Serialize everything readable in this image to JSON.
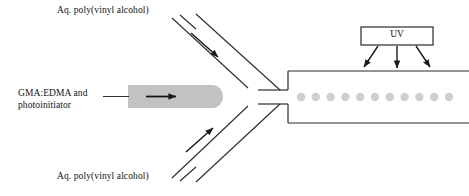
{
  "figure": {
    "background_color": "#ffffff",
    "line_color": "#2b2b2b",
    "droplet_color": "#cfcfcf",
    "tube_fill_color": "#c0c0c0"
  },
  "labels": {
    "pva_top": "Aq. poly(vinyl alcohol)",
    "pva_bottom": "Aq. poly(vinyl alcohol)",
    "dispersed_phase_line1": "GMA:EDMA and",
    "dispersed_phase_line2": "photoinitiator",
    "uv": "UV"
  },
  "channel": {
    "droplet_count": 11,
    "droplet_radius": 4.2,
    "droplet_spacing": 14.8,
    "droplet_first_x": 301,
    "droplet_y": 97,
    "top_wall_y": 71,
    "bottom_wall_y": 123,
    "outlet_start_x": 288,
    "outlet_end_x": 469,
    "neck_top_y": 90,
    "neck_bottom_y": 104,
    "neck_start_x": 258
  },
  "uv_source": {
    "box_x": 361,
    "box_y": 27,
    "box_width": 72,
    "box_height": 18,
    "arrow_count": 3,
    "arrow_directions": [
      "down-left",
      "down",
      "down-right"
    ]
  },
  "inlets": {
    "top_flow_arrow": "down-right",
    "bottom_flow_arrow": "up-right",
    "dispersed_flow_arrow": "right"
  }
}
